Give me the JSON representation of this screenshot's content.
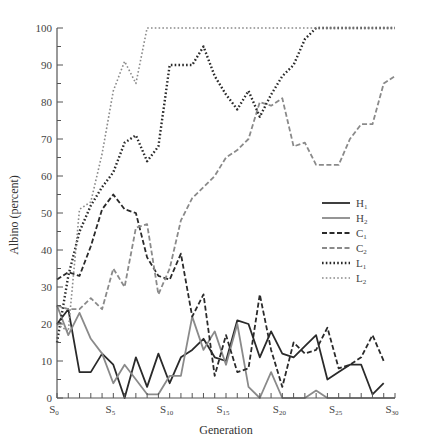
{
  "chart_data": {
    "type": "line",
    "title": "",
    "xlabel": "Generation",
    "ylabel": "Albino (percent)",
    "ylim": [
      0,
      100
    ],
    "xlim": [
      0,
      30
    ],
    "grid": false,
    "legend_position": "right-middle",
    "yticks": [
      0,
      10,
      20,
      30,
      40,
      50,
      60,
      70,
      80,
      90,
      100
    ],
    "xticks": [
      {
        "value": 0,
        "label": "S",
        "sub": "0"
      },
      {
        "value": 5,
        "label": "S",
        "sub": "5"
      },
      {
        "value": 10,
        "label": "S",
        "sub": "10"
      },
      {
        "value": 15,
        "label": "S",
        "sub": "15"
      },
      {
        "value": 20,
        "label": "S",
        "sub": "20"
      },
      {
        "value": 25,
        "label": "S",
        "sub": "25"
      },
      {
        "value": 30,
        "label": "S",
        "sub": "30"
      }
    ],
    "x": [
      0,
      1,
      2,
      3,
      4,
      5,
      6,
      7,
      8,
      9,
      10,
      11,
      12,
      13,
      14,
      15,
      16,
      17,
      18,
      19,
      20,
      21,
      22,
      23,
      24,
      25,
      26,
      27,
      28,
      29,
      30
    ],
    "series": [
      {
        "name": "H",
        "sub": "1",
        "style": "solid",
        "color": "#2a2a2a",
        "width": 1.8,
        "values": [
          20,
          24,
          7,
          7,
          12,
          9,
          0,
          11,
          3,
          12,
          4,
          11,
          13,
          16,
          11,
          10,
          21,
          20,
          11,
          18,
          12,
          11,
          14,
          17,
          5,
          7,
          9,
          9,
          1,
          4,
          null
        ]
      },
      {
        "name": "H",
        "sub": "2",
        "style": "solid",
        "color": "#8a8a8a",
        "width": 1.8,
        "values": [
          25,
          17,
          23,
          16,
          12,
          4,
          9,
          5,
          1,
          1,
          6,
          6,
          22,
          13,
          18,
          9,
          20,
          3,
          0,
          7,
          0,
          0,
          0,
          2,
          0,
          0,
          0,
          0,
          0,
          0,
          0
        ]
      },
      {
        "name": "C",
        "sub": "1",
        "style": "dashed",
        "color": "#2a2a2a",
        "width": 1.8,
        "values": [
          32,
          34,
          33,
          41,
          51,
          55,
          51,
          50,
          38,
          33,
          32,
          39,
          22,
          28,
          6,
          17,
          7,
          8,
          28,
          13,
          3,
          15,
          12,
          13,
          19,
          8,
          9,
          11,
          17,
          10,
          null
        ]
      },
      {
        "name": "C",
        "sub": "2",
        "style": "dashed",
        "color": "#8a8a8a",
        "width": 1.8,
        "values": [
          25,
          24,
          24,
          27,
          24,
          35,
          30,
          46,
          47,
          28,
          35,
          48,
          54,
          57,
          60,
          65,
          67,
          70,
          80,
          79,
          81,
          68,
          69,
          63,
          63,
          63,
          70,
          74,
          74,
          85,
          87
        ]
      },
      {
        "name": "L",
        "sub": "1",
        "style": "dotted",
        "color": "#2a2a2a",
        "width": 2.4,
        "values": [
          15,
          33,
          45,
          52,
          57,
          61,
          69,
          71,
          64,
          68,
          90,
          90,
          90,
          95,
          87,
          82,
          78,
          83,
          76,
          82,
          87,
          90,
          97,
          100,
          100,
          100,
          100,
          100,
          100,
          100,
          100
        ]
      },
      {
        "name": "L",
        "sub": "2",
        "style": "dotted",
        "color": "#8a8a8a",
        "width": 1.6,
        "values": [
          20,
          18,
          51,
          53,
          66,
          83,
          91,
          85,
          100,
          100,
          100,
          100,
          100,
          100,
          100,
          100,
          100,
          100,
          100,
          100,
          100,
          100,
          100,
          100,
          100,
          100,
          100,
          100,
          100,
          100,
          100
        ]
      }
    ]
  }
}
